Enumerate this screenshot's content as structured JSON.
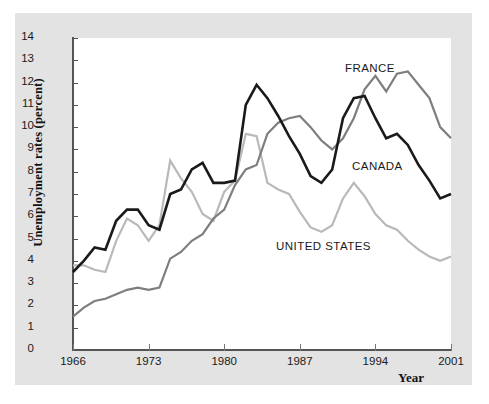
{
  "chart_data": {
    "type": "line",
    "title": "",
    "xlabel": "Year",
    "ylabel": "Unemployment rates (percent)",
    "xlim": [
      1966,
      2001
    ],
    "ylim": [
      0,
      14
    ],
    "xticks": [
      1966,
      1973,
      1980,
      1987,
      1994,
      2001
    ],
    "yticks": [
      0,
      1,
      2,
      3,
      4,
      5,
      6,
      7,
      8,
      9,
      10,
      11,
      12,
      13,
      14
    ],
    "grid": false,
    "legend_position": "inline-annotations",
    "x": [
      1966,
      1967,
      1968,
      1969,
      1970,
      1971,
      1972,
      1973,
      1974,
      1975,
      1976,
      1977,
      1978,
      1979,
      1980,
      1981,
      1982,
      1983,
      1984,
      1985,
      1986,
      1987,
      1988,
      1989,
      1990,
      1991,
      1992,
      1993,
      1994,
      1995,
      1996,
      1997,
      1998,
      1999,
      2000,
      2001
    ],
    "series": [
      {
        "name": "CANADA",
        "color": "#1a1a1a",
        "label_text": "CANADA",
        "values": [
          3.5,
          4.0,
          4.6,
          4.5,
          5.8,
          6.3,
          6.3,
          5.6,
          5.4,
          7.0,
          7.2,
          8.1,
          8.4,
          7.5,
          7.5,
          7.6,
          11.0,
          11.9,
          11.3,
          10.5,
          9.6,
          8.8,
          7.8,
          7.5,
          8.1,
          10.4,
          11.3,
          11.4,
          10.4,
          9.5,
          9.7,
          9.2,
          8.3,
          7.6,
          6.8,
          7.0
        ]
      },
      {
        "name": "FRANCE",
        "color": "#7e7e7e",
        "label_text": "FRANCE",
        "values": [
          1.5,
          1.9,
          2.2,
          2.3,
          2.5,
          2.7,
          2.8,
          2.7,
          2.8,
          4.1,
          4.4,
          4.9,
          5.2,
          5.9,
          6.3,
          7.4,
          8.1,
          8.3,
          9.7,
          10.2,
          10.4,
          10.5,
          10.0,
          9.4,
          9.0,
          9.5,
          10.4,
          11.7,
          12.3,
          11.6,
          12.4,
          12.5,
          11.9,
          11.3,
          10.0,
          9.5
        ]
      },
      {
        "name": "UNITED STATES",
        "color": "#b9b9b9",
        "label_text": "UNITED STATES",
        "values": [
          3.8,
          3.8,
          3.6,
          3.5,
          4.9,
          5.9,
          5.6,
          4.9,
          5.6,
          8.5,
          7.7,
          7.1,
          6.1,
          5.8,
          7.1,
          7.6,
          9.7,
          9.6,
          7.5,
          7.2,
          7.0,
          6.2,
          5.5,
          5.3,
          5.6,
          6.8,
          7.5,
          6.9,
          6.1,
          5.6,
          5.4,
          4.9,
          4.5,
          4.2,
          4.0,
          4.2
        ]
      }
    ]
  },
  "axes": {
    "y_title": "Unemployment rates (percent)",
    "x_title": "Year"
  }
}
